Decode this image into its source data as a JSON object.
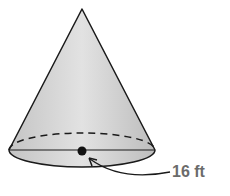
{
  "figure": {
    "shape": "cone",
    "radius_label": "16 ft",
    "colors": {
      "fill_light": "#dcdcdc",
      "fill_dark": "#b8b8b8",
      "stroke": "#1a1a1a",
      "label": "#6b6b6b"
    }
  }
}
